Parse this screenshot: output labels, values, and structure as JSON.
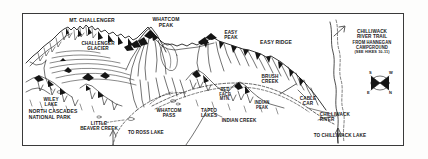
{
  "map": {
    "title": "North Cascades panoramic trail map",
    "frame": {
      "border_color": "#3a3a3a",
      "background": "#ffffff"
    },
    "ink_color": "#141414",
    "peaks": [
      {
        "name": "mt-challenger",
        "text": "MT. CHALLENGER",
        "x": 57,
        "y": 18,
        "w": 70,
        "size": "s55"
      },
      {
        "name": "whatcom-peak",
        "text": "WHATCOM\nPEAK",
        "x": 141,
        "y": 17,
        "w": 50,
        "size": "s55"
      },
      {
        "name": "easy-peak",
        "text": "EASY\nPEAK",
        "x": 212,
        "y": 30,
        "w": 38,
        "size": "s5"
      },
      {
        "name": "red-face-mtn",
        "text": "RED\nFACE\nMTN.",
        "x": 210,
        "y": 88,
        "w": 30,
        "size": "s45"
      },
      {
        "name": "indian-peak",
        "text": "INDIAN\nPEAK",
        "x": 245,
        "y": 101,
        "w": 34,
        "size": "s45"
      }
    ],
    "features": [
      {
        "name": "challenger-glacier",
        "text": "CHALLENGER\nGLACIER",
        "x": 70,
        "y": 41,
        "w": 56,
        "size": "s5"
      },
      {
        "name": "easy-ridge",
        "text": "EASY RIDGE",
        "x": 249,
        "y": 40,
        "w": 54,
        "size": "s55"
      },
      {
        "name": "brush-creek",
        "text": "BRUSH\nCREEK",
        "x": 250,
        "y": 74,
        "w": 40,
        "size": "s5"
      },
      {
        "name": "cable-car",
        "text": "CABLE\nCAR",
        "x": 291,
        "y": 96,
        "w": 34,
        "size": "s5"
      },
      {
        "name": "wiley-lake",
        "text": "WILEY\nLAKE",
        "x": 33,
        "y": 97,
        "w": 36,
        "size": "s5"
      },
      {
        "name": "whatcom-pass",
        "text": "WHATCOM\nPASS",
        "x": 147,
        "y": 108,
        "w": 44,
        "size": "s5"
      },
      {
        "name": "tapto-lakes",
        "text": "TAPTO\nLAKES",
        "x": 192,
        "y": 108,
        "w": 34,
        "size": "s5"
      },
      {
        "name": "indian-creek",
        "text": "INDIAN CREEK",
        "x": 213,
        "y": 118,
        "w": 52,
        "size": "s5"
      },
      {
        "name": "little-beaver-creek",
        "text": "LITTLE\nBEAVER CREEK",
        "x": 70,
        "y": 121,
        "w": 58,
        "size": "s5"
      },
      {
        "name": "chilliwack-river",
        "text": "CHILLIWACK\nRIVER",
        "x": 318,
        "y": 112,
        "w": 50,
        "size": "s5",
        "align": "left"
      },
      {
        "name": "north-cascades-national-park",
        "text": "NORTH CASCADES\nNATIONAL PARK",
        "x": 26,
        "y": 109,
        "w": 78,
        "size": "s55",
        "align": "left"
      }
    ],
    "directions": [
      {
        "name": "to-ross-lake",
        "text": "TO ROSS LAKE",
        "x": 126,
        "y": 130,
        "w": 54,
        "size": "s5",
        "align": "left"
      },
      {
        "name": "to-chilliwack-lake",
        "text": "TO CHILLIWACK LAKE",
        "x": 311,
        "y": 133,
        "w": 76,
        "size": "s5",
        "align": "left"
      }
    ],
    "note": {
      "name": "chilliwack-river-trail-note",
      "lines": [
        "CHILLIWACK",
        "RIVER TRAIL",
        "FROM HANNEGAN",
        "CAMPGROUND",
        "(SEE HIKES 10-11)"
      ],
      "x": 341,
      "y": 29,
      "w": 62
    },
    "compass": {
      "name": "compass-rose",
      "cx": 380,
      "cy": 83,
      "r": 9,
      "points": [
        {
          "label": "S",
          "dx": -9,
          "dy": -13
        },
        {
          "label": "W",
          "dx": 8,
          "dy": -13
        },
        {
          "label": "E",
          "dx": -11,
          "dy": 8
        },
        {
          "label": "N",
          "dx": 8,
          "dy": 8
        }
      ]
    }
  }
}
